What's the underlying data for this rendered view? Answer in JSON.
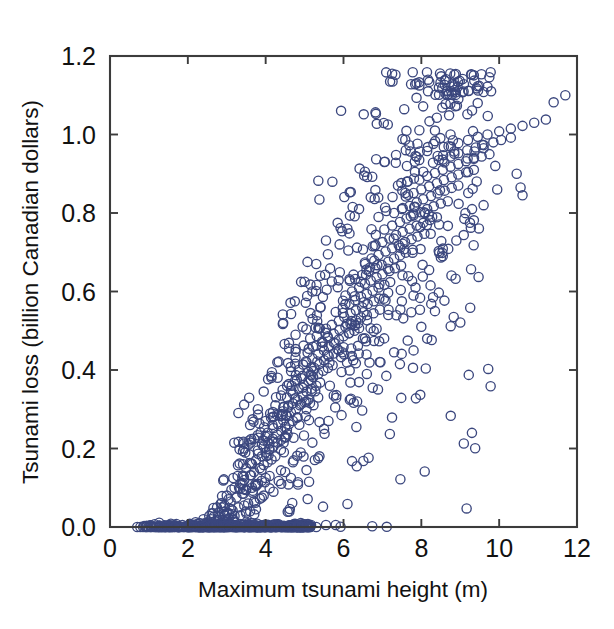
{
  "figure": {
    "background_color": "#ffffff",
    "marker_color": "#3b477e",
    "axis_color": "#3c3c3c"
  },
  "axis": {
    "x_title": "Maximum tsunami height (m)",
    "y_title": "Tsunami loss (billion Canadian dollars)",
    "x_ticks": [
      "0",
      "2",
      "4",
      "6",
      "8",
      "10",
      "12"
    ],
    "y_ticks": [
      "0.0",
      "0.2",
      "0.4",
      "0.6",
      "0.8",
      "1.0",
      "1.2"
    ]
  },
  "chart_data": {
    "type": "scatter",
    "title": "",
    "xlabel": "Maximum tsunami height (m)",
    "ylabel": "Tsunami loss (billion Canadian dollars)",
    "xlim": [
      0,
      12
    ],
    "ylim": [
      0.0,
      1.2
    ],
    "xticks": [
      0,
      2,
      4,
      6,
      8,
      10,
      12
    ],
    "yticks": [
      0.0,
      0.2,
      0.4,
      0.6,
      0.8,
      1.0,
      1.2
    ],
    "grid": false,
    "legend": null,
    "marker": "open-circle",
    "marker_color": "#3b477e",
    "n_points": 1400,
    "points": [
      [
        0.7,
        0.0
      ],
      [
        0.78,
        0.0
      ],
      [
        0.85,
        0.0
      ],
      [
        0.92,
        0.0
      ],
      [
        0.98,
        0.0
      ],
      [
        1.05,
        0.0
      ],
      [
        1.12,
        0.0
      ],
      [
        1.18,
        0.0
      ],
      [
        1.25,
        0.0
      ],
      [
        1.3,
        0.0
      ],
      [
        1.36,
        0.0
      ],
      [
        1.42,
        0.0
      ],
      [
        1.48,
        0.0
      ],
      [
        1.54,
        0.0
      ],
      [
        1.6,
        0.0
      ],
      [
        1.66,
        0.0
      ],
      [
        1.72,
        0.0
      ],
      [
        1.78,
        0.0
      ],
      [
        1.84,
        0.0
      ],
      [
        1.9,
        0.0
      ],
      [
        1.96,
        0.0
      ],
      [
        2.02,
        0.0
      ],
      [
        2.08,
        0.0
      ],
      [
        2.14,
        0.0
      ],
      [
        2.2,
        0.0
      ],
      [
        2.26,
        0.0
      ],
      [
        2.32,
        0.0
      ],
      [
        2.38,
        0.0
      ],
      [
        2.44,
        0.0
      ],
      [
        2.5,
        0.0
      ],
      [
        2.56,
        0.0
      ],
      [
        2.62,
        0.0
      ],
      [
        2.68,
        0.0
      ],
      [
        2.74,
        0.0
      ],
      [
        2.8,
        0.0
      ],
      [
        2.86,
        0.0
      ],
      [
        2.92,
        0.0
      ],
      [
        2.98,
        0.0
      ],
      [
        3.04,
        0.0
      ],
      [
        3.1,
        0.0
      ],
      [
        3.16,
        0.0
      ],
      [
        3.22,
        0.0
      ],
      [
        3.28,
        0.0
      ],
      [
        3.34,
        0.0
      ],
      [
        3.4,
        0.0
      ],
      [
        3.46,
        0.0
      ],
      [
        3.52,
        0.0
      ],
      [
        3.58,
        0.0
      ],
      [
        3.64,
        0.0
      ],
      [
        3.7,
        0.0
      ],
      [
        3.76,
        0.0
      ],
      [
        3.82,
        0.0
      ],
      [
        3.88,
        0.0
      ],
      [
        3.94,
        0.0
      ],
      [
        4.0,
        0.0
      ],
      [
        4.08,
        0.0
      ],
      [
        4.16,
        0.0
      ],
      [
        4.24,
        0.0
      ],
      [
        4.32,
        0.0
      ],
      [
        4.4,
        0.0
      ],
      [
        4.5,
        0.0
      ],
      [
        4.6,
        0.0
      ],
      [
        4.7,
        0.0
      ],
      [
        4.8,
        0.0
      ],
      [
        4.95,
        0.0
      ],
      [
        5.1,
        0.0
      ],
      [
        5.3,
        0.0
      ],
      [
        5.55,
        0.005
      ],
      [
        5.8,
        0.005
      ],
      [
        2.3,
        0.01
      ],
      [
        2.5,
        0.012
      ],
      [
        2.7,
        0.015
      ],
      [
        2.9,
        0.018
      ],
      [
        3.05,
        0.022
      ],
      [
        3.2,
        0.028
      ],
      [
        3.35,
        0.03
      ],
      [
        3.5,
        0.035
      ],
      [
        3.6,
        0.04
      ],
      [
        3.75,
        0.045
      ],
      [
        2.6,
        0.02
      ],
      [
        2.8,
        0.025
      ],
      [
        3.0,
        0.035
      ],
      [
        3.15,
        0.042
      ],
      [
        3.3,
        0.05
      ],
      [
        3.45,
        0.055
      ],
      [
        3.55,
        0.06
      ],
      [
        3.7,
        0.065
      ],
      [
        3.85,
        0.072
      ],
      [
        3.95,
        0.08
      ],
      [
        2.95,
        0.055
      ],
      [
        3.1,
        0.065
      ],
      [
        3.25,
        0.075
      ],
      [
        3.4,
        0.085
      ],
      [
        3.5,
        0.095
      ],
      [
        3.65,
        0.1
      ],
      [
        3.8,
        0.11
      ],
      [
        3.9,
        0.118
      ],
      [
        4.0,
        0.125
      ],
      [
        4.1,
        0.13
      ],
      [
        3.2,
        0.1
      ],
      [
        3.35,
        0.11
      ],
      [
        3.45,
        0.12
      ],
      [
        3.6,
        0.132
      ],
      [
        3.7,
        0.14
      ],
      [
        3.85,
        0.15
      ],
      [
        3.95,
        0.158
      ],
      [
        4.05,
        0.165
      ],
      [
        4.15,
        0.172
      ],
      [
        4.25,
        0.18
      ],
      [
        3.5,
        0.15
      ],
      [
        3.65,
        0.16
      ],
      [
        3.75,
        0.17
      ],
      [
        3.9,
        0.18
      ],
      [
        4.0,
        0.19
      ],
      [
        4.1,
        0.198
      ],
      [
        4.2,
        0.205
      ],
      [
        4.3,
        0.215
      ],
      [
        4.4,
        0.222
      ],
      [
        4.5,
        0.23
      ],
      [
        3.8,
        0.195
      ],
      [
        3.95,
        0.205
      ],
      [
        4.05,
        0.215
      ],
      [
        4.18,
        0.225
      ],
      [
        4.3,
        0.235
      ],
      [
        4.4,
        0.245
      ],
      [
        4.5,
        0.255
      ],
      [
        4.6,
        0.262
      ],
      [
        4.7,
        0.27
      ],
      [
        4.8,
        0.278
      ],
      [
        4.05,
        0.24
      ],
      [
        4.2,
        0.252
      ],
      [
        4.32,
        0.262
      ],
      [
        4.45,
        0.272
      ],
      [
        4.55,
        0.282
      ],
      [
        4.65,
        0.292
      ],
      [
        4.78,
        0.3
      ],
      [
        4.88,
        0.31
      ],
      [
        5.0,
        0.318
      ],
      [
        5.1,
        0.325
      ],
      [
        4.3,
        0.285
      ],
      [
        4.45,
        0.295
      ],
      [
        4.58,
        0.305
      ],
      [
        4.7,
        0.315
      ],
      [
        4.82,
        0.325
      ],
      [
        4.95,
        0.335
      ],
      [
        5.05,
        0.345
      ],
      [
        5.18,
        0.352
      ],
      [
        5.3,
        0.36
      ],
      [
        5.4,
        0.368
      ],
      [
        4.55,
        0.33
      ],
      [
        4.7,
        0.34
      ],
      [
        4.85,
        0.352
      ],
      [
        4.98,
        0.362
      ],
      [
        5.1,
        0.372
      ],
      [
        5.22,
        0.382
      ],
      [
        5.35,
        0.39
      ],
      [
        5.48,
        0.398
      ],
      [
        5.6,
        0.405
      ],
      [
        5.72,
        0.412
      ],
      [
        4.8,
        0.375
      ],
      [
        4.95,
        0.385
      ],
      [
        5.1,
        0.395
      ],
      [
        5.25,
        0.405
      ],
      [
        5.38,
        0.415
      ],
      [
        5.5,
        0.425
      ],
      [
        5.62,
        0.435
      ],
      [
        5.75,
        0.442
      ],
      [
        5.88,
        0.45
      ],
      [
        6.0,
        0.458
      ],
      [
        5.05,
        0.42
      ],
      [
        5.2,
        0.43
      ],
      [
        5.35,
        0.44
      ],
      [
        5.5,
        0.45
      ],
      [
        5.62,
        0.46
      ],
      [
        5.75,
        0.47
      ],
      [
        5.88,
        0.478
      ],
      [
        6.0,
        0.486
      ],
      [
        6.15,
        0.494
      ],
      [
        6.28,
        0.5
      ],
      [
        5.3,
        0.462
      ],
      [
        5.45,
        0.472
      ],
      [
        5.6,
        0.482
      ],
      [
        5.75,
        0.492
      ],
      [
        5.9,
        0.502
      ],
      [
        6.05,
        0.51
      ],
      [
        6.18,
        0.518
      ],
      [
        6.32,
        0.526
      ],
      [
        6.45,
        0.534
      ],
      [
        6.6,
        0.54
      ],
      [
        5.55,
        0.505
      ],
      [
        5.7,
        0.515
      ],
      [
        5.88,
        0.525
      ],
      [
        6.02,
        0.535
      ],
      [
        6.18,
        0.544
      ],
      [
        6.32,
        0.552
      ],
      [
        6.48,
        0.56
      ],
      [
        6.62,
        0.568
      ],
      [
        6.78,
        0.575
      ],
      [
        6.92,
        0.582
      ],
      [
        5.8,
        0.548
      ],
      [
        5.98,
        0.558
      ],
      [
        6.15,
        0.568
      ],
      [
        6.3,
        0.578
      ],
      [
        6.45,
        0.586
      ],
      [
        6.6,
        0.594
      ],
      [
        6.75,
        0.602
      ],
      [
        6.9,
        0.61
      ],
      [
        7.05,
        0.617
      ],
      [
        7.2,
        0.624
      ],
      [
        6.05,
        0.59
      ],
      [
        6.22,
        0.6
      ],
      [
        6.4,
        0.61
      ],
      [
        6.55,
        0.62
      ],
      [
        6.7,
        0.628
      ],
      [
        6.85,
        0.636
      ],
      [
        7.0,
        0.644
      ],
      [
        7.18,
        0.652
      ],
      [
        7.32,
        0.659
      ],
      [
        7.48,
        0.666
      ],
      [
        6.3,
        0.632
      ],
      [
        6.48,
        0.642
      ],
      [
        6.65,
        0.652
      ],
      [
        6.82,
        0.66
      ],
      [
        6.98,
        0.668
      ],
      [
        7.15,
        0.676
      ],
      [
        7.3,
        0.684
      ],
      [
        7.45,
        0.692
      ],
      [
        7.6,
        0.699
      ],
      [
        7.78,
        0.706
      ],
      [
        6.55,
        0.674
      ],
      [
        6.72,
        0.684
      ],
      [
        6.9,
        0.693
      ],
      [
        7.08,
        0.702
      ],
      [
        7.25,
        0.71
      ],
      [
        7.42,
        0.718
      ],
      [
        7.58,
        0.726
      ],
      [
        7.75,
        0.733
      ],
      [
        7.9,
        0.74
      ],
      [
        8.08,
        0.747
      ],
      [
        6.8,
        0.716
      ],
      [
        7.0,
        0.726
      ],
      [
        7.18,
        0.735
      ],
      [
        7.35,
        0.744
      ],
      [
        7.52,
        0.752
      ],
      [
        7.7,
        0.76
      ],
      [
        7.88,
        0.768
      ],
      [
        8.05,
        0.775
      ],
      [
        8.22,
        0.782
      ],
      [
        8.4,
        0.789
      ],
      [
        7.05,
        0.758
      ],
      [
        7.25,
        0.768
      ],
      [
        7.45,
        0.777
      ],
      [
        7.62,
        0.786
      ],
      [
        7.8,
        0.794
      ],
      [
        7.98,
        0.802
      ],
      [
        8.15,
        0.81
      ],
      [
        8.32,
        0.817
      ],
      [
        8.5,
        0.824
      ],
      [
        8.68,
        0.83
      ],
      [
        7.3,
        0.8
      ],
      [
        7.5,
        0.81
      ],
      [
        7.7,
        0.818
      ],
      [
        7.88,
        0.827
      ],
      [
        8.05,
        0.835
      ],
      [
        8.25,
        0.843
      ],
      [
        8.42,
        0.85
      ],
      [
        8.6,
        0.857
      ],
      [
        8.78,
        0.864
      ],
      [
        8.95,
        0.87
      ],
      [
        7.6,
        0.842
      ],
      [
        7.8,
        0.851
      ],
      [
        8.0,
        0.86
      ],
      [
        8.2,
        0.868
      ],
      [
        8.4,
        0.876
      ],
      [
        8.58,
        0.884
      ],
      [
        8.78,
        0.891
      ],
      [
        8.95,
        0.898
      ],
      [
        9.15,
        0.904
      ],
      [
        9.35,
        0.91
      ],
      [
        7.95,
        0.885
      ],
      [
        8.15,
        0.894
      ],
      [
        8.35,
        0.902
      ],
      [
        8.55,
        0.91
      ],
      [
        8.75,
        0.918
      ],
      [
        8.95,
        0.925
      ],
      [
        9.15,
        0.932
      ],
      [
        9.35,
        0.938
      ],
      [
        9.55,
        0.944
      ],
      [
        9.75,
        0.95
      ],
      [
        8.3,
        0.928
      ],
      [
        8.55,
        0.936
      ],
      [
        8.75,
        0.944
      ],
      [
        8.95,
        0.952
      ],
      [
        9.18,
        0.96
      ],
      [
        9.4,
        0.967
      ],
      [
        9.6,
        0.973
      ],
      [
        9.85,
        0.98
      ],
      [
        10.05,
        0.986
      ],
      [
        10.3,
        0.992
      ],
      [
        8.7,
        0.97
      ],
      [
        8.95,
        0.978
      ],
      [
        9.2,
        0.986
      ],
      [
        9.45,
        0.994
      ],
      [
        9.7,
        1.0
      ],
      [
        10.0,
        1.008
      ],
      [
        10.3,
        1.015
      ],
      [
        10.6,
        1.022
      ],
      [
        10.9,
        1.03
      ],
      [
        11.2,
        1.038
      ],
      [
        7.95,
        1.125
      ],
      [
        8.6,
        1.138
      ],
      [
        8.35,
        1.01
      ],
      [
        8.75,
        1.0
      ],
      [
        9.6,
        0.965
      ],
      [
        9.9,
        0.92
      ],
      [
        10.45,
        0.9
      ],
      [
        10.55,
        0.865
      ],
      [
        10.6,
        0.845
      ],
      [
        11.4,
        1.082
      ],
      [
        11.7,
        1.1
      ],
      [
        6.55,
        0.905
      ],
      [
        7.05,
        0.93
      ],
      [
        7.35,
        0.948
      ],
      [
        7.6,
        0.96
      ],
      [
        7.85,
        0.945
      ],
      [
        8.15,
        0.958
      ],
      [
        4.95,
        0.51
      ],
      [
        5.15,
        0.545
      ],
      [
        4.3,
        0.42
      ],
      [
        4.6,
        0.455
      ],
      [
        3.95,
        0.345
      ],
      [
        4.15,
        0.38
      ],
      [
        3.6,
        0.26
      ],
      [
        3.8,
        0.3
      ],
      [
        5.6,
        0.695
      ],
      [
        5.9,
        0.72
      ],
      [
        6.1,
        0.76
      ],
      [
        5.4,
        0.64
      ],
      [
        5.2,
        0.6
      ],
      [
        6.4,
        0.81
      ],
      [
        6.7,
        0.84
      ],
      [
        6.9,
        0.79
      ],
      [
        7.1,
        0.805
      ],
      [
        7.4,
        0.87
      ],
      [
        7.65,
        0.88
      ],
      [
        8.05,
        0.905
      ],
      [
        8.45,
        0.935
      ],
      [
        4.45,
        0.52
      ],
      [
        4.75,
        0.575
      ],
      [
        5.0,
        0.625
      ],
      [
        5.3,
        0.67
      ],
      [
        5.55,
        0.73
      ],
      [
        5.85,
        0.775
      ],
      [
        3.45,
        0.2
      ],
      [
        3.7,
        0.225
      ],
      [
        4.0,
        0.27
      ],
      [
        4.25,
        0.31
      ],
      [
        4.55,
        0.36
      ],
      [
        4.85,
        0.4
      ],
      [
        2.85,
        0.06
      ],
      [
        3.0,
        0.08
      ],
      [
        3.12,
        0.095
      ],
      [
        3.28,
        0.13
      ],
      [
        3.42,
        0.16
      ],
      [
        3.58,
        0.185
      ],
      [
        2.4,
        0.02
      ],
      [
        2.65,
        0.035
      ],
      [
        2.75,
        0.05
      ],
      [
        2.55,
        0.028
      ],
      [
        2.2,
        0.012
      ],
      [
        2.05,
        0.008
      ],
      [
        6.2,
        0.455
      ],
      [
        6.5,
        0.48
      ],
      [
        6.85,
        0.505
      ],
      [
        7.15,
        0.54
      ],
      [
        7.5,
        0.575
      ],
      [
        7.85,
        0.61
      ],
      [
        8.2,
        0.655
      ],
      [
        8.55,
        0.69
      ],
      [
        8.9,
        0.73
      ],
      [
        9.25,
        0.775
      ],
      [
        9.6,
        0.82
      ],
      [
        9.95,
        0.86
      ],
      [
        6.6,
        0.39
      ],
      [
        6.95,
        0.42
      ],
      [
        7.3,
        0.445
      ],
      [
        7.65,
        0.475
      ],
      [
        8.0,
        0.51
      ],
      [
        8.35,
        0.55
      ],
      [
        5.05,
        0.3
      ],
      [
        5.35,
        0.33
      ],
      [
        5.65,
        0.36
      ],
      [
        5.95,
        0.395
      ],
      [
        6.25,
        0.425
      ],
      [
        5.75,
        0.335
      ],
      [
        4.9,
        0.19
      ],
      [
        5.2,
        0.215
      ],
      [
        5.5,
        0.25
      ],
      [
        4.7,
        0.165
      ],
      [
        4.5,
        0.14
      ],
      [
        5.95,
        0.285
      ],
      [
        6.35,
        0.32
      ],
      [
        6.75,
        0.355
      ],
      [
        7.1,
        0.385
      ],
      [
        7.45,
        0.415
      ],
      [
        7.8,
        0.45
      ],
      [
        8.15,
        0.48
      ],
      [
        4.2,
        0.09
      ],
      [
        4.4,
        0.11
      ],
      [
        4.65,
        0.125
      ],
      [
        3.9,
        0.075
      ],
      [
        5.05,
        0.145
      ],
      [
        5.35,
        0.175
      ]
    ]
  }
}
